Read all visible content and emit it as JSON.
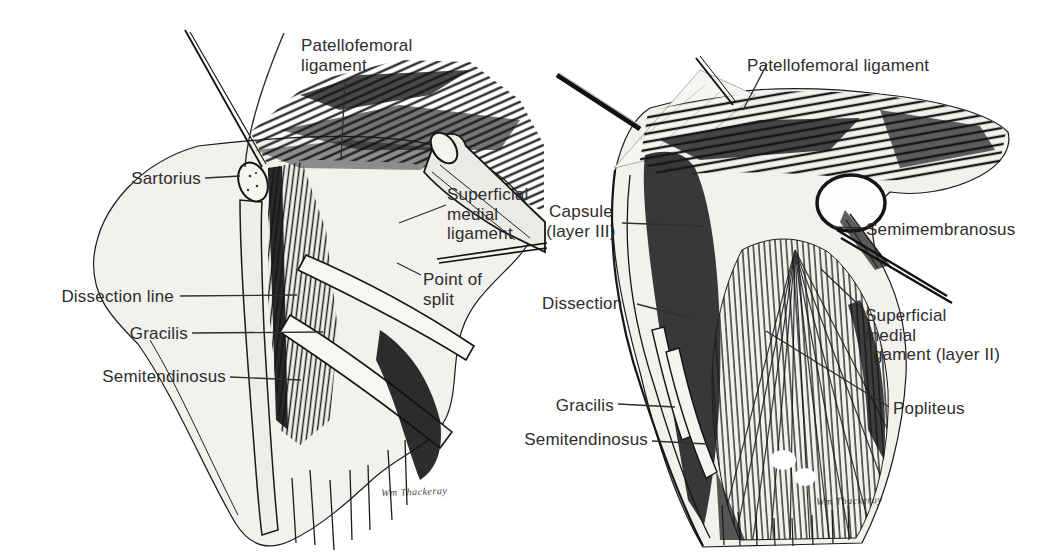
{
  "figure": {
    "type": "anatomical-illustration",
    "colors": {
      "ink": "#1a1a1a",
      "paper": "#ffffff",
      "label_text": "#2d2d2d"
    },
    "panels": {
      "left": {
        "labels": {
          "patellofemoral": "Patellofemoral\nligament",
          "sartorius": "Sartorius",
          "superficial_medial": "Superficial\nmedial\nligament",
          "dissection_line": "Dissection line",
          "point_of_split": "Point of\nsplit",
          "gracilis": "Gracilis",
          "semitendinosus": "Semitendinosus"
        },
        "signature": "Wm Thackeray"
      },
      "right": {
        "labels": {
          "patellofemoral": "Patellofemoral ligament",
          "capsule": "Capsule\n(layer III)",
          "semimembranosus": "Semimembranosus",
          "dissection": "Dissection",
          "superficial_medial": "Superficial\nmedial\nligament (layer II)",
          "popliteus": "Popliteus",
          "gracilis": "Gracilis",
          "semitendinosus": "Semitendinosus"
        },
        "signature": "Wm Thackeray"
      }
    }
  }
}
